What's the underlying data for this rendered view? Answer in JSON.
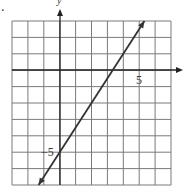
{
  "chart_data": {
    "type": "line",
    "title": "",
    "xlabel": "x",
    "ylabel": "y",
    "xlim": [
      -3,
      7
    ],
    "ylim": [
      -7,
      3
    ],
    "grid": true,
    "tick_labels": {
      "x": [
        "5"
      ],
      "y": [
        "-5"
      ]
    },
    "series": [
      {
        "name": "y = 1.5x - 5",
        "equation": "y = (3/2)x - 5",
        "points": [
          [
            -1.33,
            -7
          ],
          [
            0,
            -5
          ],
          [
            3.33,
            0
          ],
          [
            5.33,
            3
          ]
        ],
        "arrows": "both"
      }
    ]
  },
  "labels": {
    "y_axis": "y",
    "x_axis": "x",
    "x_tick": "5",
    "y_tick": "−5",
    "marker": "."
  },
  "colors": {
    "grid": "#555555",
    "axis": "#222222",
    "line": "#333333"
  }
}
